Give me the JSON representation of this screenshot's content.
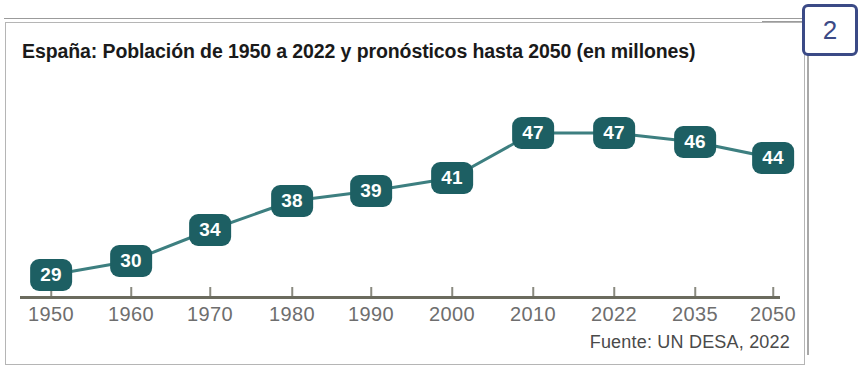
{
  "page": {
    "number_label": "2"
  },
  "chart_panel": {
    "title": "España: Población de 1950 a 2022 y pronósticos hasta 2050 (en millones)",
    "source": "Fuente: UN DESA, 2022"
  },
  "colors": {
    "marker_fill": "#1d5f63",
    "marker_text": "#ffffff",
    "line": "#3d7f80",
    "axis": "#6b6b5e",
    "tick_label": "#6e6e6e",
    "title": "#1a1a1a",
    "callout_border": "#3b4a86",
    "panel_border": "#b5b5b5"
  },
  "chart_data": {
    "type": "line",
    "title": "España: Población de 1950 a 2022 y pronósticos hasta 2050 (en millones)",
    "xlabel": "",
    "ylabel": "",
    "categories": [
      "1950",
      "1960",
      "1970",
      "1980",
      "1990",
      "2000",
      "2010",
      "2022",
      "2035",
      "2050"
    ],
    "values": [
      29,
      30,
      34,
      38,
      39,
      41,
      47,
      47,
      46,
      44
    ],
    "value_labels": [
      "29",
      "30",
      "34",
      "38",
      "39",
      "41",
      "47",
      "47",
      "46",
      "44"
    ],
    "source": "Fuente: UN DESA, 2022",
    "ylim": [
      26,
      49
    ],
    "grid": false,
    "legend": false,
    "units": "millones",
    "points": [
      {
        "x": "1950",
        "y": 29,
        "px": 45,
        "py": 252
      },
      {
        "x": "1960",
        "y": 30,
        "px": 125,
        "py": 238
      },
      {
        "x": "1970",
        "y": 34,
        "px": 204,
        "py": 207
      },
      {
        "x": "1980",
        "y": 38,
        "px": 286,
        "py": 178
      },
      {
        "x": "1990",
        "y": 39,
        "px": 365,
        "py": 168
      },
      {
        "x": "2000",
        "y": 41,
        "px": 446,
        "py": 155
      },
      {
        "x": "2010",
        "y": 47,
        "px": 527,
        "py": 110
      },
      {
        "x": "2022",
        "y": 47,
        "px": 608,
        "py": 110
      },
      {
        "x": "2035",
        "y": 46,
        "px": 689,
        "py": 119
      },
      {
        "x": "2050",
        "y": 44,
        "px": 767,
        "py": 135
      }
    ]
  }
}
